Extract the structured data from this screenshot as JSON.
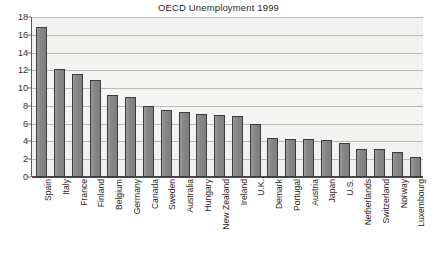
{
  "chart_data": {
    "type": "bar",
    "title": "OECD Unemployment 1999",
    "xlabel": "",
    "ylabel": "",
    "ylim": [
      0,
      18
    ],
    "ytick_step": 2,
    "yticks": [
      0,
      2,
      4,
      6,
      8,
      10,
      12,
      14,
      16,
      18
    ],
    "grid": true,
    "legend": "none",
    "orientation": "vertical",
    "bar_color": "#8a8a8a",
    "bar_border_color": "#3b3b3b",
    "plot_background": "#f3f3f2",
    "categories": [
      "Spain",
      "Italy",
      "France",
      "Finland",
      "Belgium",
      "Germany",
      "Canada",
      "Sweden",
      "Australia",
      "Hungary",
      "New Zealand",
      "Ireland",
      "U.K.",
      "Demark",
      "Portugal",
      "Austria",
      "Japan",
      "U.S.",
      "Netherlands",
      "Switzerland",
      "Norway",
      "Luxembourg"
    ],
    "values": [
      16.9,
      12.2,
      11.6,
      10.9,
      9.2,
      9.0,
      8.0,
      7.5,
      7.3,
      7.1,
      7.0,
      6.9,
      6.0,
      4.4,
      4.3,
      4.3,
      4.2,
      3.8,
      3.1,
      3.1,
      2.8,
      2.2
    ]
  },
  "footer": {
    "clipped_text": "..................."
  }
}
